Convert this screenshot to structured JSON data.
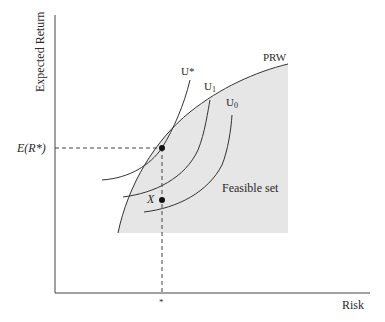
{
  "diagram": {
    "type": "portfolio-choice",
    "axes": {
      "x_label": "Risk",
      "y_label": "Expected Return",
      "x_tick_label": "*",
      "y_tick_label": "E(R*)"
    },
    "curves": {
      "frontier_label": "PRW",
      "indifference": [
        {
          "label": "U*",
          "main": "U",
          "sub": "*"
        },
        {
          "label": "U1",
          "main": "U",
          "sub": "1"
        },
        {
          "label": "U0",
          "main": "U",
          "sub": "0"
        }
      ]
    },
    "regions": {
      "feasible_label": "Feasible set"
    },
    "points": {
      "optimum": "tangency point",
      "x_label": "X"
    },
    "colors": {
      "line": "#333333",
      "fill": "#e6e6e6",
      "background": "#ffffff"
    }
  }
}
